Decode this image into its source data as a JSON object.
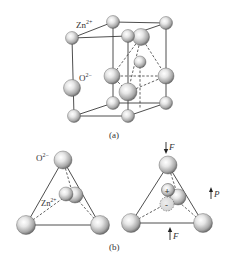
{
  "figure": {
    "panel_a": {
      "caption": "(a)",
      "labels": {
        "zn": "Zn",
        "zn_sup": "2+",
        "o": "O",
        "o_sup": "2−"
      },
      "description": "Wurtzite ZnO unit cell with tetrahedral coordination"
    },
    "panel_b": {
      "caption": "(b)",
      "left": {
        "labels": {
          "o": "O",
          "o_sup": "2−",
          "zn": "Zn",
          "zn_sup": "2+"
        },
        "description": "Unstrained tetrahedron: charge centers coincide"
      },
      "right": {
        "force_top": "F",
        "force_bottom": "F",
        "polarization": "P",
        "plus_sign": "+",
        "minus_sign": "-",
        "description": "Compressed tetrahedron: separated positive and negative charge centers produce polarization P"
      }
    },
    "colors": {
      "sphere_light": "#f4f4f4",
      "sphere_mid": "#bdbdbd",
      "sphere_dark": "#6a6a6a",
      "line": "#3a3a3a",
      "negative_fill": "#d9d9d9"
    }
  }
}
